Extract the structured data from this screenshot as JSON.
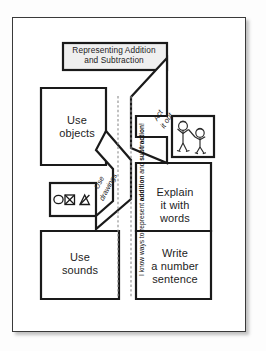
{
  "page": {
    "kind": "foldable graphic organizer worksheet",
    "background_color": "#ffffff",
    "frame_color": "#3a3a3a",
    "title_box_fill": "#efefef"
  },
  "title_box": {
    "line1": "Representing Addition",
    "line2": "and Subtraction"
  },
  "spine": {
    "prefix": "I know ways to represent ",
    "bold1": "addition",
    "middle": " and ",
    "bold2": "subtraction",
    "suffix": "!"
  },
  "panels": [
    {
      "id": "use-objects",
      "line1": "Use",
      "line2": "objects",
      "position": "top-left"
    },
    {
      "id": "use-sounds",
      "line1": "Use",
      "line2": "sounds",
      "position": "bottom-left"
    },
    {
      "id": "explain-words",
      "line1": "Explain",
      "line2": "it with",
      "line3": "words",
      "position": "middle-right"
    },
    {
      "id": "write-number",
      "line1": "Write",
      "line2": "a number",
      "line3": "sentence",
      "position": "bottom-right"
    }
  ],
  "flaps": [
    {
      "id": "act-it-out",
      "line1": "Act",
      "line2": "it out",
      "rotated": true
    },
    {
      "id": "use-drawings",
      "line1": "Use",
      "line2": "drawings",
      "rotated": true
    }
  ],
  "illustrations": [
    {
      "id": "two-children-acting",
      "description": "two stick-figure children"
    },
    {
      "id": "shape-drawings",
      "description": "circle, crossed square and triangle marks"
    }
  ]
}
